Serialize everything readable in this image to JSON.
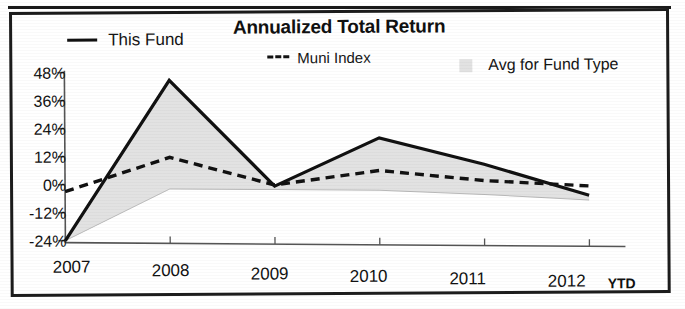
{
  "chart_data": {
    "type": "line",
    "title": "Annualized Total Return",
    "xlabel": "",
    "ylabel": "",
    "categories": [
      "2007",
      "2008",
      "2009",
      "2010",
      "2011",
      "2012"
    ],
    "x_axis_suffix": "YTD",
    "ytick_labels": [
      "48%",
      "36%",
      "24%",
      "12%",
      "0%",
      "-12%",
      "-24%"
    ],
    "ytick_values": [
      48,
      36,
      24,
      12,
      0,
      -12,
      -24
    ],
    "ylim": [
      -24,
      48
    ],
    "grid": false,
    "legend_position": "top",
    "series": [
      {
        "name": "This Fund",
        "style": "solid",
        "color": "#111111",
        "values": [
          -24,
          45,
          0,
          21,
          10,
          -3
        ]
      },
      {
        "name": "Muni Index",
        "style": "dashed",
        "color": "#111111",
        "values": [
          -3,
          12,
          0.5,
          7,
          3,
          1
        ]
      },
      {
        "name": "Avg for Fund Type",
        "style": "area",
        "color": "#e2e2e2",
        "values": [
          -24,
          45,
          0,
          21,
          10,
          -3
        ],
        "band_lower": [
          -24,
          -1.5,
          -1.5,
          -1.5,
          -3,
          -5
        ]
      }
    ]
  },
  "chart": {
    "title": "Annualized Total Return",
    "legend": [
      {
        "label": "This Fund",
        "marker": "solid-line-swatch"
      },
      {
        "label": "Muni Index",
        "marker": "dashed-line-swatch"
      },
      {
        "label": "Avg for Fund Type",
        "marker": "area-swatch"
      }
    ],
    "y_axis": {
      "ticks": [
        "48%",
        "36%",
        "24%",
        "12%",
        "0%",
        "-12%",
        "-24%"
      ]
    },
    "x_axis": {
      "ticks": [
        "2007",
        "2008",
        "2009",
        "2010",
        "2011",
        "2012"
      ],
      "suffix": "YTD"
    },
    "colors": {
      "line": "#111111",
      "area": "#e2e2e2",
      "axis": "#555555",
      "border": "#1c1c1c"
    }
  }
}
